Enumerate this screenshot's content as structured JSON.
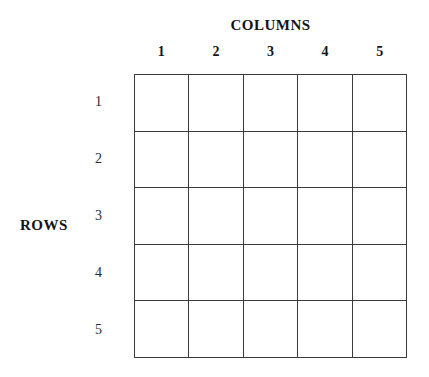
{
  "figure": {
    "background_color": "#ffffff",
    "line_color": "#3a3a3a",
    "text_color": "#151515"
  },
  "columns_axis": {
    "title": "COLUMNS",
    "labels": [
      "1",
      "2",
      "3",
      "4",
      "5"
    ]
  },
  "rows_axis": {
    "title": "ROWS",
    "labels": [
      "1",
      "2",
      "3",
      "4",
      "5"
    ]
  },
  "grid": {
    "row_count": 5,
    "column_count": 5,
    "cells": [
      [
        "",
        "",
        "",
        "",
        ""
      ],
      [
        "",
        "",
        "",
        "",
        ""
      ],
      [
        "",
        "",
        "",
        "",
        ""
      ],
      [
        "",
        "",
        "",
        "",
        ""
      ],
      [
        "",
        "",
        "",
        "",
        ""
      ]
    ]
  }
}
